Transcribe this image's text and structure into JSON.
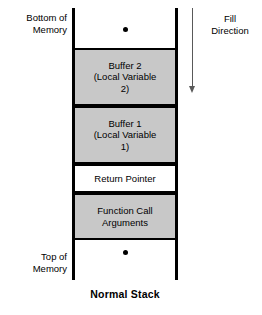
{
  "diagram": {
    "caption": "Normal Stack",
    "colors": {
      "filled_region": "#c8c8c8",
      "plain_region": "#ffffff",
      "border": "#000000",
      "arrow": "#595959"
    },
    "labels": {
      "bottom_of_memory_line1": "Bottom of",
      "bottom_of_memory_line2": "Memory",
      "top_of_memory_line1": "Top of",
      "top_of_memory_line2": "Memory",
      "fill_direction_line1": "Fill",
      "fill_direction_line2": "Direction"
    },
    "regions": [
      {
        "id": "upper-empty",
        "fill": "empty",
        "lines": []
      },
      {
        "id": "buffer-2",
        "fill": "filled",
        "lines": [
          "Buffer 2",
          "(Local Variable",
          "2)"
        ]
      },
      {
        "id": "buffer-1",
        "fill": "filled",
        "lines": [
          "Buffer 1",
          "(Local Variable",
          "1)"
        ]
      },
      {
        "id": "return-pointer",
        "fill": "plain",
        "lines": [
          "Return Pointer"
        ]
      },
      {
        "id": "function-call-arguments",
        "fill": "filled",
        "lines": [
          "Function Call",
          "Arguments"
        ]
      },
      {
        "id": "lower-empty",
        "fill": "empty",
        "lines": []
      }
    ]
  }
}
